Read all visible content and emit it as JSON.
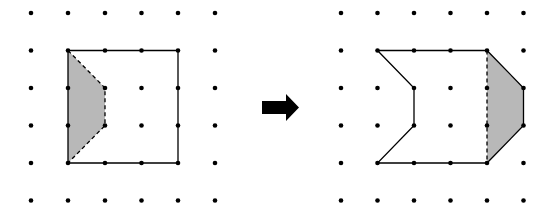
{
  "diagram": {
    "colors": {
      "dot": "#000000",
      "line": "#000000",
      "shade": "#b8b8b8",
      "arrow": "#000000",
      "background": "#ffffff"
    },
    "grid": {
      "rows": 6,
      "cols": 6,
      "y": [
        13,
        50.5,
        88,
        125.5,
        163,
        200.5
      ],
      "left_x": [
        31,
        68,
        105,
        141.5,
        178,
        215
      ],
      "right_x": [
        341,
        377.5,
        414,
        450.5,
        487,
        523.5
      ]
    },
    "before": {
      "label": "original square with shaded cut piece",
      "outline_grid_points": [
        [
          1,
          1
        ],
        [
          4,
          1
        ],
        [
          4,
          4
        ],
        [
          1,
          4
        ]
      ],
      "shaded_piece_grid_points": [
        [
          1,
          1
        ],
        [
          2,
          2
        ],
        [
          2,
          3
        ],
        [
          1,
          4
        ]
      ],
      "dashed_edges": [
        [
          [
            1,
            1
          ],
          [
            2,
            2
          ]
        ],
        [
          [
            2,
            2
          ],
          [
            2,
            3
          ]
        ],
        [
          [
            2,
            3
          ],
          [
            1,
            4
          ]
        ]
      ]
    },
    "arrow": {
      "icon": "right-arrow-icon",
      "direction": "right"
    },
    "after": {
      "label": "resulting shape after translating shaded piece",
      "outline_grid_points": [
        [
          1,
          1
        ],
        [
          2,
          2
        ],
        [
          2,
          3
        ],
        [
          1,
          4
        ],
        [
          4,
          4
        ],
        [
          5,
          3
        ],
        [
          5,
          2
        ],
        [
          4,
          1
        ]
      ],
      "shaded_piece_grid_points": [
        [
          4,
          1
        ],
        [
          5,
          2
        ],
        [
          5,
          3
        ],
        [
          4,
          4
        ]
      ],
      "dashed_edges": [
        [
          [
            4,
            1
          ],
          [
            4,
            4
          ]
        ]
      ]
    }
  }
}
